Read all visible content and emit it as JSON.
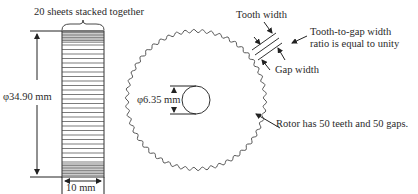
{
  "stack_view": {
    "title": "20 sheets stacked together",
    "diameter_label": "φ34.90 mm",
    "width_label": "10 mm",
    "sheet_count": 20
  },
  "rotor_view": {
    "bore_label": "φ6.35 mm",
    "tooth_width_label": "Tooth width",
    "gap_width_label": "Gap width",
    "ratio_note_line1": "Tooth-to-gap width",
    "ratio_note_line2": "ratio is equal to unity",
    "teeth_note": "Rotor has 50 teeth and 50 gaps.",
    "teeth": 50,
    "gaps": 50
  },
  "colors": {
    "line": "#333333",
    "text": "#2a2a2a",
    "background": "#ffffff"
  }
}
